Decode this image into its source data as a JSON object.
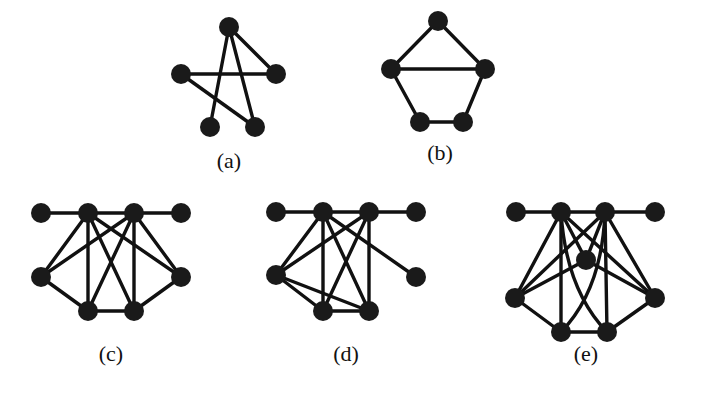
{
  "figure": {
    "node_radius": 10,
    "colors": {
      "node": "#1a1a1a",
      "edge": "#111111",
      "background": "#ffffff"
    },
    "graphs": [
      {
        "id": "a",
        "label": "(a)",
        "label_pos": [
          229,
          168
        ],
        "nodes": [
          [
            229,
            27
          ],
          [
            181,
            74
          ],
          [
            276,
            74
          ],
          [
            210,
            127
          ],
          [
            255,
            127
          ]
        ],
        "edges": [
          [
            0,
            3
          ],
          [
            0,
            4
          ],
          [
            0,
            2
          ],
          [
            1,
            2
          ],
          [
            1,
            4
          ]
        ],
        "curves": []
      },
      {
        "id": "b",
        "label": "(b)",
        "label_pos": [
          440,
          160
        ],
        "nodes": [
          [
            438,
            21
          ],
          [
            391,
            69
          ],
          [
            485,
            69
          ],
          [
            420,
            122
          ],
          [
            463,
            122
          ]
        ],
        "edges": [
          [
            0,
            1
          ],
          [
            0,
            2
          ],
          [
            1,
            2
          ],
          [
            1,
            3
          ],
          [
            2,
            4
          ],
          [
            3,
            4
          ]
        ],
        "curves": []
      },
      {
        "id": "c",
        "label": "(c)",
        "label_pos": [
          111,
          361
        ],
        "nodes": [
          [
            41,
            213
          ],
          [
            88,
            213
          ],
          [
            134,
            213
          ],
          [
            181,
            213
          ],
          [
            41,
            277
          ],
          [
            181,
            277
          ],
          [
            88,
            311
          ],
          [
            134,
            311
          ]
        ],
        "edges": [
          [
            0,
            1
          ],
          [
            1,
            2
          ],
          [
            2,
            3
          ],
          [
            1,
            4
          ],
          [
            1,
            5
          ],
          [
            1,
            6
          ],
          [
            1,
            7
          ],
          [
            2,
            4
          ],
          [
            2,
            5
          ],
          [
            2,
            6
          ],
          [
            2,
            7
          ],
          [
            4,
            6
          ],
          [
            5,
            7
          ],
          [
            6,
            7
          ]
        ],
        "curves": []
      },
      {
        "id": "d",
        "label": "(d)",
        "label_pos": [
          346,
          361
        ],
        "nodes": [
          [
            276,
            212
          ],
          [
            323,
            212
          ],
          [
            369,
            212
          ],
          [
            416,
            212
          ],
          [
            276,
            275
          ],
          [
            416,
            277
          ],
          [
            323,
            311
          ],
          [
            369,
            311
          ]
        ],
        "edges": [
          [
            0,
            1
          ],
          [
            1,
            2
          ],
          [
            2,
            3
          ],
          [
            1,
            4
          ],
          [
            1,
            5
          ],
          [
            1,
            6
          ],
          [
            1,
            7
          ],
          [
            2,
            4
          ],
          [
            2,
            6
          ],
          [
            2,
            7
          ],
          [
            4,
            6
          ],
          [
            4,
            7
          ],
          [
            6,
            7
          ]
        ],
        "curves": []
      },
      {
        "id": "e",
        "label": "(e)",
        "label_pos": [
          586,
          361
        ],
        "nodes": [
          [
            516,
            212
          ],
          [
            561,
            212
          ],
          [
            605,
            212
          ],
          [
            655,
            212
          ],
          [
            586,
            260
          ],
          [
            515,
            298
          ],
          [
            655,
            298
          ],
          [
            561,
            332
          ],
          [
            607,
            332
          ]
        ],
        "edges": [
          [
            0,
            1
          ],
          [
            1,
            2
          ],
          [
            2,
            3
          ],
          [
            1,
            4
          ],
          [
            2,
            4
          ],
          [
            1,
            5
          ],
          [
            1,
            6
          ],
          [
            1,
            7
          ],
          [
            2,
            5
          ],
          [
            2,
            6
          ],
          [
            2,
            8
          ],
          [
            4,
            5
          ],
          [
            4,
            6
          ],
          [
            5,
            7
          ],
          [
            6,
            8
          ],
          [
            7,
            8
          ]
        ],
        "curves": [
          {
            "from": 1,
            "to": 8,
            "ctrl": [
              566,
              290
            ]
          },
          {
            "from": 2,
            "to": 7,
            "ctrl": [
              602,
              290
            ]
          }
        ]
      }
    ]
  }
}
